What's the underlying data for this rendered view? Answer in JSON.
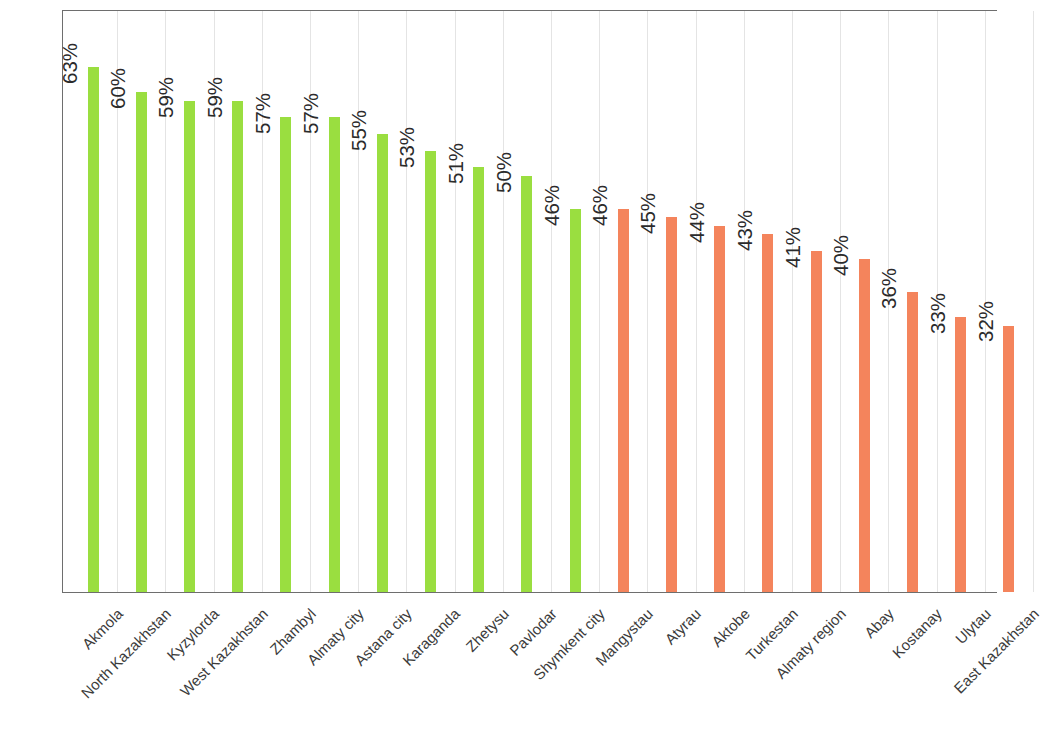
{
  "chart_data": {
    "type": "bar",
    "title": "",
    "subtitle": "",
    "xlabel": "",
    "ylabel": "",
    "ylim": [
      0,
      70
    ],
    "grid": "vertical-category-gridlines",
    "legend": "none",
    "value_label_suffix": "%",
    "value_label_rotation": -90,
    "category_label_rotation": -45,
    "colors": {
      "green": "#9ade40",
      "orange": "#f4845c",
      "border": "#6e6e6e",
      "gridline": "#e4e4e4",
      "label_text": "#3b3b3b",
      "value_text": "#2b2b2b",
      "background": "#ffffff"
    },
    "categories": [
      "Akmola",
      "North Kazakhstan",
      "Kyzylorda",
      "West Kazakhstan",
      "Zhambyl",
      "Almaty city",
      "Astana city",
      "Karaganda",
      "Zhetysu",
      "Pavlodar",
      "Shymkent city",
      "Mangystau",
      "Atyrau",
      "Aktobe",
      "Turkestan",
      "Almaty region",
      "Abay",
      "Kostanay",
      "Ulytau",
      "East Kazakhstan"
    ],
    "values": [
      63,
      60,
      59,
      59,
      57,
      57,
      55,
      53,
      51,
      50,
      46,
      46,
      45,
      44,
      43,
      41,
      40,
      36,
      33,
      32
    ],
    "value_labels": [
      "63%",
      "60%",
      "59%",
      "59%",
      "57%",
      "57%",
      "55%",
      "53%",
      "51%",
      "50%",
      "46%",
      "46%",
      "45%",
      "44%",
      "43%",
      "41%",
      "40%",
      "36%",
      "33%",
      "32%"
    ],
    "bar_colors": [
      "green",
      "green",
      "green",
      "green",
      "green",
      "green",
      "green",
      "green",
      "green",
      "green",
      "green",
      "orange",
      "orange",
      "orange",
      "orange",
      "orange",
      "orange",
      "orange",
      "orange",
      "orange"
    ]
  }
}
